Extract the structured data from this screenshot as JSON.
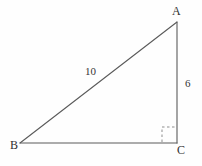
{
  "figure": {
    "background_color": "#fefefe",
    "stroke_color": "#555555",
    "text_color": "#303030"
  },
  "vertices": {
    "a": {
      "label": "A",
      "x": 177,
      "y": 22
    },
    "b": {
      "label": "B",
      "x": 20,
      "y": 143
    },
    "c": {
      "label": "C",
      "x": 177,
      "y": 143
    }
  },
  "sides": {
    "hypotenuse": {
      "label": "10",
      "from": "B",
      "to": "A"
    },
    "vertical_leg": {
      "label": "6",
      "from": "A",
      "to": "C"
    },
    "horizontal_leg": {
      "label": "",
      "from": "B",
      "to": "C"
    }
  },
  "right_angle": {
    "at_vertex": "C",
    "style": "dashed-square",
    "size": 15
  }
}
